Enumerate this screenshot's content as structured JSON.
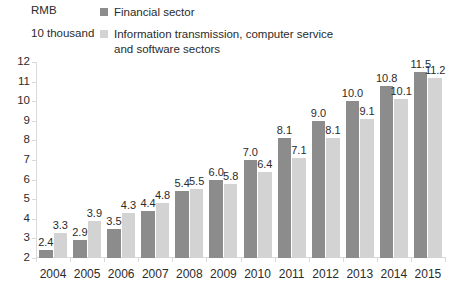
{
  "unit": {
    "line1": "RMB",
    "line2": "10 thousand"
  },
  "legend": {
    "position": "top",
    "items": [
      {
        "label": "Financial sector",
        "color": "#8c8c8c",
        "swatch_name": "legend-swatch-financial"
      },
      {
        "label": "Information transmission, computer service and software sectors",
        "color": "#d3d3d3",
        "swatch_name": "legend-swatch-infotech"
      }
    ]
  },
  "chart_data": {
    "type": "bar",
    "title": "",
    "subtitle": "",
    "xlabel": "",
    "ylabel": "RMB 10 thousand",
    "categories": [
      "2004",
      "2005",
      "2006",
      "2007",
      "2008",
      "2009",
      "2010",
      "2011",
      "2012",
      "2013",
      "2014",
      "2015"
    ],
    "series": [
      {
        "name": "Financial sector",
        "color": "#8c8c8c",
        "values": [
          2.4,
          2.9,
          3.5,
          4.4,
          5.4,
          6.0,
          7.0,
          8.1,
          9.0,
          10.0,
          10.8,
          11.5
        ],
        "labels": [
          "2.4",
          "2.9",
          "3.5",
          "4.4",
          "5.4",
          "6.0",
          "7.0",
          "8.1",
          "9.0",
          "10.0",
          "10.8",
          "11.5"
        ]
      },
      {
        "name": "Information transmission, computer service and software sectors",
        "color": "#d3d3d3",
        "values": [
          3.3,
          3.9,
          4.3,
          4.8,
          5.5,
          5.8,
          6.4,
          7.1,
          8.1,
          9.1,
          10.1,
          11.2
        ],
        "labels": [
          "3.3",
          "3.9",
          "4.3",
          "4.8",
          "5.5",
          "5.8",
          "6.4",
          "7.1",
          "8.1",
          "9.1",
          "10.1",
          "11.2"
        ]
      }
    ],
    "ylim": [
      2,
      12
    ],
    "yticks": [
      "2",
      "3",
      "4",
      "5",
      "6",
      "7",
      "8",
      "9",
      "10",
      "11",
      "12"
    ],
    "grid": false,
    "axis_color": "#d9d9d9"
  }
}
